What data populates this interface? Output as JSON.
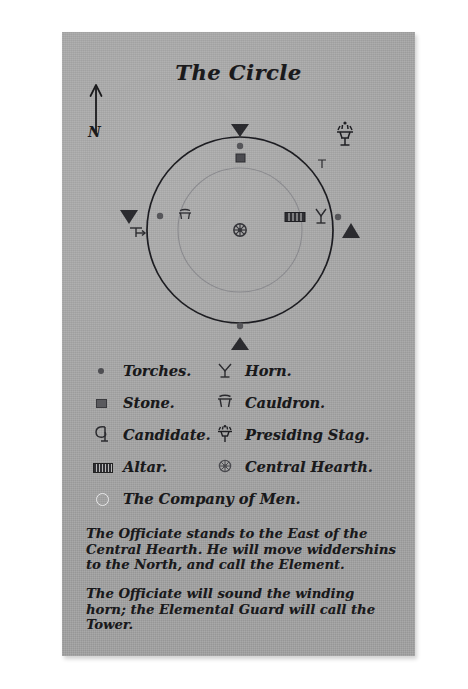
{
  "document": {
    "title": "The Circle",
    "compass": {
      "label": "N",
      "icon": "north-arrow-icon"
    }
  },
  "diagram": {
    "name": "ritual-circle-diagram",
    "cardinal_markers": [
      {
        "position": "north",
        "icon": "triangle-down-icon"
      },
      {
        "position": "east",
        "icon": "triangle-up-icon"
      },
      {
        "position": "south",
        "icon": "triangle-up-icon"
      },
      {
        "position": "west",
        "icon": "triangle-down-icon"
      }
    ],
    "placements": [
      {
        "label": "Central Hearth",
        "icon": "hearth-wheel-icon",
        "position": "center"
      },
      {
        "label": "Torch",
        "icon": "torch-dot-icon",
        "position": "north-inner"
      },
      {
        "label": "Stone",
        "icon": "stone-icon",
        "position": "north-inner-2"
      },
      {
        "label": "Torch",
        "icon": "torch-dot-icon",
        "position": "west-inner"
      },
      {
        "label": "Cauldron",
        "icon": "cauldron-icon",
        "position": "west-inner-2"
      },
      {
        "label": "Altar",
        "icon": "altar-icon",
        "position": "east-inner"
      },
      {
        "label": "Horn",
        "icon": "horn-icon",
        "position": "east-inner-2"
      },
      {
        "label": "Torch",
        "icon": "torch-dot-icon",
        "position": "east-inner-3"
      },
      {
        "label": "Torch",
        "icon": "torch-dot-icon",
        "position": "south-inner"
      },
      {
        "label": "Candidate",
        "icon": "candidate-icon",
        "position": "west-outer"
      },
      {
        "label": "Presiding Stag",
        "icon": "stag-icon",
        "position": "north-east-outer"
      }
    ]
  },
  "legend": {
    "name": "symbol-legend",
    "rows": [
      {
        "left": {
          "icon": "torch-dot-icon",
          "label": "Torches."
        },
        "right": {
          "icon": "horn-icon",
          "label": "Horn."
        }
      },
      {
        "left": {
          "icon": "stone-icon",
          "label": "Stone."
        },
        "right": {
          "icon": "cauldron-icon",
          "label": "Cauldron."
        }
      },
      {
        "left": {
          "icon": "candidate-icon",
          "label": "Candidate."
        },
        "right": {
          "icon": "stag-icon",
          "label": "Presiding Stag."
        }
      },
      {
        "left": {
          "icon": "altar-icon",
          "label": "Altar."
        },
        "right": {
          "icon": "hearth-wheel-icon",
          "label": "Central Hearth."
        }
      }
    ],
    "full_width_row": {
      "icon": "company-circle-icon",
      "label": "The Company of Men."
    }
  },
  "instructions": [
    "The Officiate stands to the East of the Central Hearth. He will move widdershins to the North, and call the Element.",
    "The Officiate will sound the winding horn; the Elemental Guard will call the Tower."
  ],
  "colors": {
    "paper": "#a9a9a9",
    "ink": "#19191b",
    "page_background": "#ffffff"
  }
}
